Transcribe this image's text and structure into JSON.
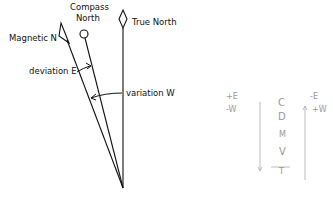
{
  "diagram": {
    "labels": {
      "compass_north_line1": "Compass",
      "compass_north_line2": "North",
      "true_north": "True North",
      "magnetic_north": "Magnetic N",
      "deviation": "deviation E",
      "variation": "variation W"
    },
    "handwritten_notes": {
      "left_top": "+E",
      "left_bottom": "-W",
      "right_top": "-E",
      "right_bottom": "+W",
      "sequence": [
        "C",
        "D",
        "M",
        "V",
        "T"
      ]
    },
    "colors": {
      "ink": "#111111",
      "pencil": "#999999"
    }
  }
}
